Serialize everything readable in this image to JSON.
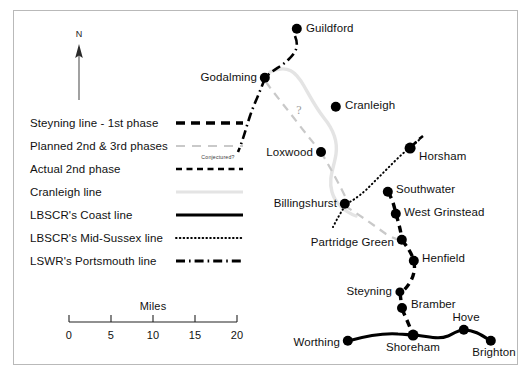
{
  "figure": {
    "kind": "historical-railway-map",
    "region": "Sussex and Surrey, England",
    "north_arrow_label": "N",
    "conjectured_note": "Conjectured?",
    "uncertainty_marker": "?"
  },
  "colors": {
    "ink": "#000000",
    "frame": "#b9b9b9",
    "planned_grey": "#c9c9c9",
    "cranleigh_grey": "#e2e2e2",
    "label": "#111111"
  },
  "legend": {
    "items": [
      {
        "label": "Steyning line - 1st phase",
        "style": "thick-dashed-black",
        "name": "steyning-first-phase"
      },
      {
        "label": "Planned 2nd & 3rd phases",
        "style": "thin-dashed-grey",
        "name": "planned-2nd-3rd-phases"
      },
      {
        "label": "Actual 2nd phase",
        "style": "medium-dashed-black",
        "name": "actual-2nd-phase"
      },
      {
        "label": "Cranleigh line",
        "style": "solid-light-grey",
        "name": "cranleigh-line"
      },
      {
        "label": "LBSCR's Coast line",
        "style": "solid-black",
        "name": "lbscr-coast-line"
      },
      {
        "label": "LBSCR's Mid-Sussex line",
        "style": "dotted-black",
        "name": "lbscr-mid-sussex-line"
      },
      {
        "label": "LSWR's Portsmouth line",
        "style": "dash-dot-black",
        "name": "lswr-portsmouth-line"
      }
    ]
  },
  "scale": {
    "title": "Miles",
    "ticks": [
      "0",
      "5",
      "10",
      "15",
      "20"
    ],
    "tick_values": [
      0,
      5,
      10,
      15,
      20
    ],
    "unit": "miles"
  },
  "places": [
    {
      "name": "Guildford",
      "label": "Guildford",
      "x": 297,
      "y": 29,
      "r": 5.2,
      "anchor": "l",
      "lx": 306,
      "ly": 29
    },
    {
      "name": "Godalming",
      "label": "Godalming",
      "x": 265,
      "y": 78,
      "r": 5.2,
      "anchor": "r",
      "lx": 257,
      "ly": 78
    },
    {
      "name": "Cranleigh",
      "label": "Cranleigh",
      "x": 336,
      "y": 107,
      "r": 5.2,
      "anchor": "l",
      "lx": 345,
      "ly": 106
    },
    {
      "name": "Loxwood",
      "label": "Loxwood",
      "x": 321,
      "y": 152,
      "r": 5.0,
      "anchor": "r",
      "lx": 313,
      "ly": 153
    },
    {
      "name": "Horsham",
      "label": "Horsham",
      "x": 410,
      "y": 148,
      "r": 5.4,
      "anchor": "l",
      "lx": 419,
      "ly": 157
    },
    {
      "name": "Billingshurst",
      "label": "Billingshurst",
      "x": 345,
      "y": 204,
      "r": 5.2,
      "anchor": "r",
      "lx": 337,
      "ly": 204
    },
    {
      "name": "Southwater",
      "label": "Southwater",
      "x": 388,
      "y": 192,
      "r": 5.2,
      "anchor": "l",
      "lx": 396,
      "ly": 190
    },
    {
      "name": "West Grinstead",
      "label": "West Grinstead",
      "x": 396,
      "y": 214,
      "r": 5.2,
      "anchor": "l",
      "lx": 404,
      "ly": 213
    },
    {
      "name": "Partridge Green",
      "label": "Partridge Green",
      "x": 402,
      "y": 240,
      "r": 5.2,
      "anchor": "r",
      "lx": 394,
      "ly": 243
    },
    {
      "name": "Henfield",
      "label": "Henfield",
      "x": 414,
      "y": 261,
      "r": 5.2,
      "anchor": "l",
      "lx": 422,
      "ly": 259
    },
    {
      "name": "Steyning",
      "label": "Steyning",
      "x": 400,
      "y": 292,
      "r": 4.6,
      "anchor": "r",
      "lx": 392,
      "ly": 292
    },
    {
      "name": "Bramber",
      "label": "Bramber",
      "x": 402,
      "y": 308,
      "r": 5.0,
      "anchor": "l",
      "lx": 411,
      "ly": 305
    },
    {
      "name": "Shoreham",
      "label": "Shoreham",
      "x": 413,
      "y": 335,
      "r": 5.4,
      "anchor": "c",
      "lx": 413,
      "ly": 348
    },
    {
      "name": "Hove",
      "label": "Hove",
      "x": 464,
      "y": 330,
      "r": 5.2,
      "anchor": "c",
      "lx": 466,
      "ly": 318
    },
    {
      "name": "Brighton",
      "label": "Brighton",
      "x": 491,
      "y": 341,
      "r": 5.2,
      "anchor": "c",
      "lx": 494,
      "ly": 353
    },
    {
      "name": "Worthing",
      "label": "Worthing",
      "x": 348,
      "y": 341,
      "r": 5.2,
      "anchor": "r",
      "lx": 340,
      "ly": 343
    }
  ]
}
